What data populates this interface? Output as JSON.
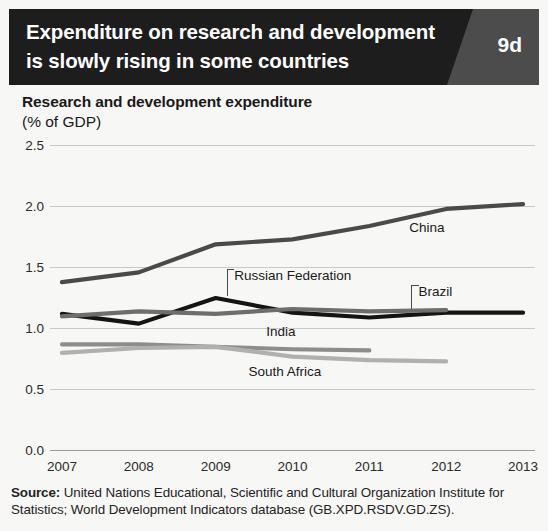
{
  "header": {
    "title_line1": "Expenditure on research and development",
    "title_line2": "is slowly rising in some countries",
    "badge": "9d",
    "banner_color": "#1d1d1d",
    "badge_panel_color": "#4c4c4c"
  },
  "subtitle": {
    "main": "Research and development expenditure",
    "unit": "(% of GDP)"
  },
  "source": {
    "label": "Source:",
    "text": " United Nations Educational, Scientific and Cultural Organization Institute for Statistics; World Development Indicators database (GB.XPD.RSDV.GD.ZS)."
  },
  "chart_data": {
    "type": "line",
    "title": "Expenditure on research and development is slowly rising in some countries",
    "subtitle": "Research and development expenditure (% of GDP)",
    "xlabel": "",
    "ylabel": "Research and development expenditure (% of GDP)",
    "x": [
      2007,
      2008,
      2009,
      2010,
      2011,
      2012,
      2013
    ],
    "xticklabels": [
      "2007",
      "2008",
      "2009",
      "2010",
      "2011",
      "2012",
      "2013"
    ],
    "yticks": [
      0.0,
      0.5,
      1.0,
      1.5,
      2.0,
      2.5
    ],
    "yticklabels": [
      "0.0",
      "0.5",
      "1.0",
      "1.5",
      "2.0",
      "2.5"
    ],
    "ylim": [
      0.0,
      2.5
    ],
    "xlim": [
      2007,
      2013
    ],
    "grid": true,
    "legend": "inline-labels",
    "series": [
      {
        "name": "China",
        "color": "#4a4a4a",
        "width": 4.2,
        "values": [
          1.38,
          1.46,
          1.69,
          1.73,
          1.84,
          1.98,
          2.02
        ],
        "label_x": 2011.75,
        "label_y": 1.79,
        "leader": false
      },
      {
        "name": "Russian Federation",
        "color": "#141414",
        "width": 4.2,
        "values": [
          1.12,
          1.04,
          1.25,
          1.13,
          1.09,
          1.13,
          1.13
        ],
        "label_x": 2009.15,
        "label_y": 1.4,
        "leader": true,
        "leader_to_y": 1.27
      },
      {
        "name": "Brazil",
        "color": "#6e6e6e",
        "width": 4.2,
        "values": [
          1.1,
          1.14,
          1.12,
          1.16,
          1.14,
          1.15,
          null
        ],
        "label_x": 2011.55,
        "label_y": 1.27,
        "leader": true,
        "leader_to_y": 1.16
      },
      {
        "name": "India",
        "color": "#8d8d8d",
        "width": 4.2,
        "values": [
          0.87,
          0.87,
          0.85,
          0.83,
          0.82,
          null,
          null
        ],
        "label_x": 2009.85,
        "label_y": 0.94,
        "leader": false
      },
      {
        "name": "South Africa",
        "color": "#b0b0b0",
        "width": 4.2,
        "values": [
          0.8,
          0.84,
          0.85,
          0.77,
          0.74,
          0.73,
          null
        ],
        "label_x": 2009.9,
        "label_y": 0.61,
        "leader": false
      }
    ]
  }
}
